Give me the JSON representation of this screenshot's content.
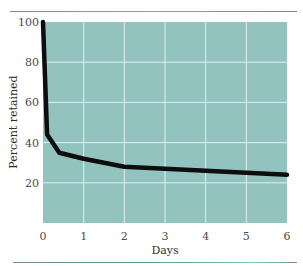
{
  "chart_data": {
    "type": "line",
    "title": "",
    "xlabel": "Days",
    "ylabel": "Percent retained",
    "xlim": [
      0,
      6
    ],
    "ylim": [
      0,
      100
    ],
    "xticks": [
      0,
      1,
      2,
      3,
      4,
      5,
      6
    ],
    "yticks": [
      20,
      40,
      60,
      80,
      100
    ],
    "grid": true,
    "legend": null,
    "series": [
      {
        "name": "Percent retained",
        "x": [
          0,
          0.1,
          0.4,
          1,
          2,
          3,
          4,
          5,
          6
        ],
        "values": [
          100,
          44,
          35,
          32,
          28,
          27,
          26,
          25,
          24
        ]
      }
    ]
  },
  "colors": {
    "plot_background": "#93c3bf",
    "gridline": "#dff0ee",
    "curve": "#0d0d0d",
    "rule": "#7fa9a2"
  }
}
